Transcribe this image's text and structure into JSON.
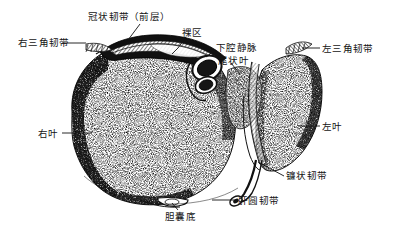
{
  "figure": {
    "type": "anatomical-line-drawing",
    "background_color": "#ffffff",
    "ink_color": "#111111",
    "stipple_color": "#1a1a1a",
    "width": 393,
    "height": 235
  },
  "labels": [
    {
      "id": "coronary-ligament-anterior",
      "text": "冠状韧带（前层）",
      "x": 88,
      "y": 12,
      "anchor": "left"
    },
    {
      "id": "bare-area",
      "text": "裸区",
      "x": 182,
      "y": 28,
      "anchor": "left"
    },
    {
      "id": "right-triangular-ligament",
      "text": "右三角韧带",
      "x": 18,
      "y": 38,
      "anchor": "left"
    },
    {
      "id": "inferior-vena-cava",
      "text": "下腔静脉",
      "x": 216,
      "y": 43,
      "anchor": "left"
    },
    {
      "id": "caudate-lobe",
      "text": "尾状叶",
      "x": 218,
      "y": 56,
      "anchor": "left"
    },
    {
      "id": "left-triangular-ligament",
      "text": "左三角韧带",
      "x": 322,
      "y": 44,
      "anchor": "left"
    },
    {
      "id": "right-lobe",
      "text": "右叶",
      "x": 38,
      "y": 129,
      "anchor": "left"
    },
    {
      "id": "left-lobe",
      "text": "左叶",
      "x": 322,
      "y": 122,
      "anchor": "left"
    },
    {
      "id": "falciform-ligament",
      "text": "镰状韧带",
      "x": 286,
      "y": 171,
      "anchor": "left"
    },
    {
      "id": "round-ligament-of-liver",
      "text": "肝圆韧带",
      "x": 238,
      "y": 196,
      "anchor": "left"
    },
    {
      "id": "gallbladder-fundus",
      "text": "胆囊底",
      "x": 165,
      "y": 212,
      "anchor": "left"
    }
  ],
  "structures": [
    {
      "id": "liver-body",
      "name": "肝"
    },
    {
      "id": "right-lobe-mass",
      "name": "右叶"
    },
    {
      "id": "left-lobe-mass",
      "name": "左叶"
    },
    {
      "id": "bare-area-band",
      "name": "裸区"
    },
    {
      "id": "coronary-ligament-band",
      "name": "冠状韧带"
    },
    {
      "id": "ivc-ring",
      "name": "下腔静脉"
    },
    {
      "id": "caudate-lobe-mass",
      "name": "尾状叶"
    },
    {
      "id": "falciform-ligament-fold",
      "name": "镰状韧带"
    },
    {
      "id": "round-ligament-cord",
      "name": "肝圆韧带"
    },
    {
      "id": "gallbladder-fundus-bump",
      "name": "胆囊底"
    },
    {
      "id": "right-triangular-fold",
      "name": "右三角韧带"
    },
    {
      "id": "left-triangular-fold",
      "name": "左三角韧带"
    }
  ],
  "leader_lines": [
    {
      "id": "leader-coronary-ligament",
      "points": "140,24 128,40 120,47"
    },
    {
      "id": "leader-bare-area",
      "points": "186,37 178,48 172,54"
    },
    {
      "id": "leader-right-triangular",
      "points": "62,43 86,43"
    },
    {
      "id": "leader-inferior-vena-cava",
      "points": "215,50 206,57"
    },
    {
      "id": "leader-caudate-lobe",
      "points": "231,63 240,74"
    },
    {
      "id": "leader-left-triangular",
      "points": "320,48 302,48"
    },
    {
      "id": "leader-right-lobe",
      "points": "62,133 92,133"
    },
    {
      "id": "leader-left-lobe",
      "points": "320,126 298,126"
    },
    {
      "id": "leader-falciform-ligament",
      "points": "284,176 258,162"
    },
    {
      "id": "leader-round-ligament",
      "points": "236,200 212,200"
    },
    {
      "id": "leader-gallbladder-fundus",
      "points": "178,210 172,203"
    }
  ]
}
